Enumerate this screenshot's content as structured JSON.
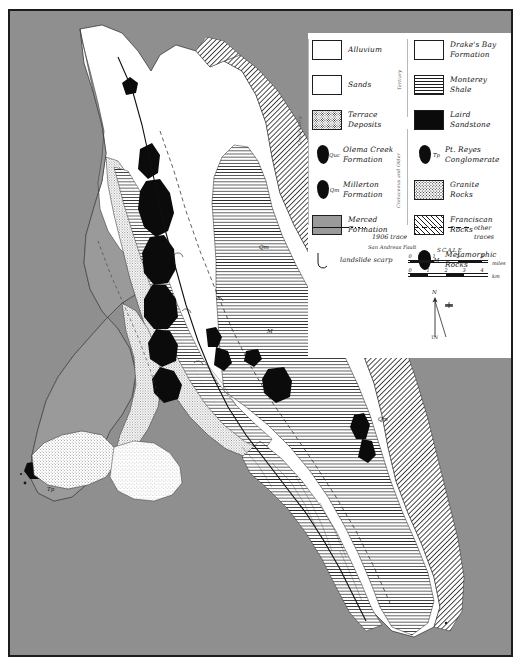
{
  "map": {
    "title": "Geologic map of the Point Reyes Peninsula",
    "frame_color": "#1c1c1c",
    "ocean_color": "#8f8f8f",
    "land_color": "#ffffff",
    "codes": [
      {
        "id": "qm-north",
        "label": "Qm",
        "x": 250,
        "y": 239
      },
      {
        "id": "m-center",
        "label": "M",
        "x": 259,
        "y": 323
      },
      {
        "id": "qm-south",
        "label": "Qm",
        "x": 370,
        "y": 411
      },
      {
        "id": "tp-headland",
        "label": "Tp",
        "x": 39,
        "y": 481
      }
    ]
  },
  "legend": {
    "vertical_labels": {
      "left": "Quaternary",
      "middle_top": "Tertiary",
      "middle_bottom": "Cretaceous and Older"
    },
    "left_column": [
      {
        "name": "alluvium",
        "pattern": "p-allu",
        "swatch": "box",
        "code": "",
        "label": "Alluvium"
      },
      {
        "name": "sands",
        "pattern": "p-sand",
        "swatch": "box",
        "code": "",
        "label": "Sands"
      },
      {
        "name": "terrace-deposits",
        "pattern": "p-terr",
        "swatch": "box",
        "code": "",
        "label": "Terrace\nDeposits"
      },
      {
        "name": "olema-creek",
        "pattern": "",
        "swatch": "blob",
        "code": "Quc",
        "label": "Olema Creek\nFormation"
      },
      {
        "name": "millerton",
        "pattern": "",
        "swatch": "blob",
        "code": "Qm",
        "label": "Millerton\nFormation"
      },
      {
        "name": "merced",
        "pattern": "p-merced",
        "swatch": "box",
        "code": "",
        "label": "Merced\nFormation"
      }
    ],
    "right_column": [
      {
        "name": "drakes-bay",
        "pattern": "p-drakes",
        "swatch": "box",
        "code": "",
        "label": "Drake's Bay\nFormation"
      },
      {
        "name": "monterey-shale",
        "pattern": "p-monterey",
        "swatch": "box",
        "code": "",
        "label": "Monterey\nShale"
      },
      {
        "name": "laird-sandstone",
        "pattern": "p-laird",
        "swatch": "box",
        "code": "",
        "label": "Laird\nSandstone"
      },
      {
        "name": "pt-reyes-cong",
        "pattern": "",
        "swatch": "blob",
        "code": "Tp",
        "label": "Pt. Reyes\nConglomerate"
      },
      {
        "name": "granite-rocks",
        "pattern": "p-granite",
        "swatch": "box",
        "code": "",
        "label": "Granite\nRocks"
      },
      {
        "name": "franciscan-rocks",
        "pattern": "p-francis",
        "swatch": "box",
        "code": "",
        "label": "Franciscan\nRocks"
      },
      {
        "name": "metamorphic",
        "pattern": "",
        "swatch": "blob",
        "code": "M",
        "label": "Metamorphic\nRocks"
      }
    ],
    "scarp": {
      "label": "landslide scarp"
    },
    "fault_key": {
      "trace_1906": "1906 trace",
      "trace_1906_sub": "San Andreas Fault",
      "other_traces": "other traces"
    }
  },
  "scale": {
    "title": "SCALE",
    "miles_unit": "miles",
    "km_unit": "km",
    "miles_ticks": [
      "0",
      "1",
      "2",
      "3"
    ],
    "km_ticks": [
      "0",
      "1",
      "2",
      "3",
      "4"
    ]
  },
  "north_arrow": {
    "north_label": "N",
    "bottom_label": "TN"
  }
}
